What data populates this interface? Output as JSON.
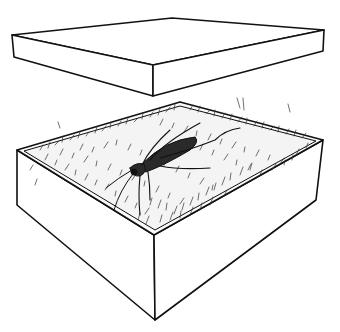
{
  "illustration": {
    "subject": "Insect (cockroach) on grass bedding inside an open box with lid lifted above",
    "colors": {
      "background": "#ffffff",
      "line": "#111111",
      "insect": "#2a2a2a",
      "grass": "#333333"
    },
    "objects": [
      {
        "name": "lid",
        "description": "Rectangular box lid floating above"
      },
      {
        "name": "box",
        "description": "Open rectangular box"
      },
      {
        "name": "bedding",
        "description": "Grass/straw lining inside box"
      },
      {
        "name": "insect",
        "description": "Cockroach with long antennae"
      }
    ]
  }
}
